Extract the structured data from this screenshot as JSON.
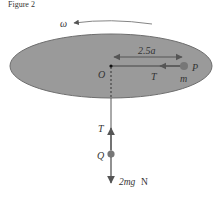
{
  "header_fragment": "Figure 2",
  "labels": {
    "omega": "ω",
    "distance": "2.5a",
    "origin": "O",
    "tension_top": "T",
    "particle_p": "P",
    "mass_m": "m",
    "tension_bottom": "T",
    "particle_q": "Q",
    "weight": "2mg",
    "weight_unit": "N"
  },
  "colors": {
    "disc_fill": "#9a9a9a",
    "disc_stroke": "#6e6e6e",
    "arrow": "#555555",
    "particle": "#777777",
    "text": "#333333"
  }
}
